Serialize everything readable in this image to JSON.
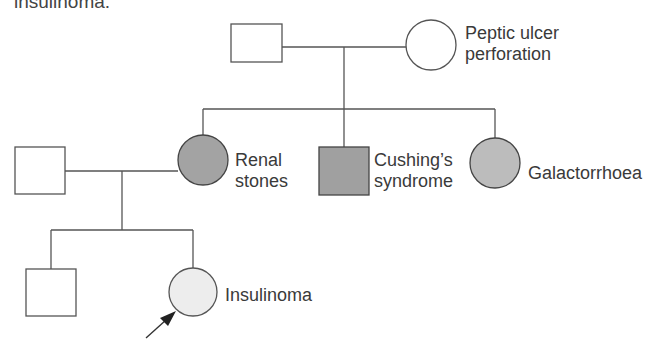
{
  "caption": "insulinoma.",
  "colors": {
    "line": "#555555",
    "affected_dark": "#9a9a9a",
    "affected_medium": "#b9b9b9",
    "affected_light": "#ededed",
    "unaffected": "#ffffff"
  },
  "pedigree": {
    "generation_1": {
      "father": {
        "shape": "square",
        "status": "unaffected",
        "label": ""
      },
      "mother": {
        "shape": "circle",
        "status": "affected",
        "label_line1": "Peptic ulcer",
        "label_line2": "perforation"
      }
    },
    "generation_2": {
      "spouse": {
        "shape": "square",
        "status": "unaffected",
        "label": ""
      },
      "daughter_1": {
        "shape": "circle",
        "status": "affected",
        "label_line1": "Renal",
        "label_line2": "stones"
      },
      "son": {
        "shape": "square",
        "status": "affected",
        "label_line1": "Cushing’s",
        "label_line2": "syndrome"
      },
      "daughter_2": {
        "shape": "circle",
        "status": "affected",
        "label": "Galactorrhoea"
      }
    },
    "generation_3": {
      "son": {
        "shape": "square",
        "status": "unaffected",
        "label": ""
      },
      "proband": {
        "shape": "circle",
        "status": "affected",
        "label": "Insulinoma",
        "marker": "proband-arrow"
      }
    }
  }
}
